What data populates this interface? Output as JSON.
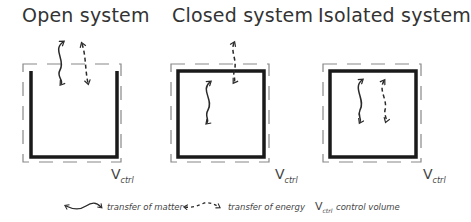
{
  "systems": [
    {
      "title": "Open system",
      "volume_label": "V",
      "volume_sub": "ctrl"
    },
    {
      "title": "Closed system",
      "volume_label": "V",
      "volume_sub": "ctrl"
    },
    {
      "title": "Isolated system",
      "volume_label": "V",
      "volume_sub": "ctrl"
    }
  ],
  "legend": {
    "matter": "transfer of matter",
    "energy": "transfer of energy",
    "volume_symbol": "V",
    "volume_sub": "ctrl",
    "volume": "control volume"
  },
  "colors": {
    "wall": "#1a1a1a",
    "dashed": "#888888",
    "arrow": "#2a2a2a"
  }
}
